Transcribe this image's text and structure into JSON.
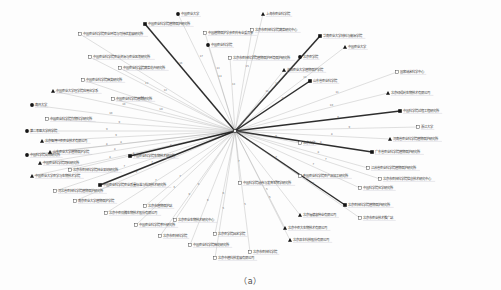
{
  "figure": {
    "caption": "（a）",
    "type": "radial-hub-network",
    "background": "#fdfdfd",
    "edge_color": "#8d8d8d",
    "edge_color_strong": "#1b1b1b",
    "label_color": "#3a3a3a",
    "weight_color": "#6e6e6e",
    "underline_color": "#b9b9c8"
  },
  "hub": {
    "label": "",
    "x": 235,
    "y": 131,
    "marker": "hub-point",
    "color": "#2a2a2a"
  },
  "legend_markers": {
    "filled-circle": "●",
    "hollow-square": "□",
    "filled-square": "■",
    "triangle": "▲"
  },
  "chart_data": {
    "type": "scatter",
    "title": "",
    "xlabel": "",
    "ylabel": "",
    "legend": [],
    "nodes": [
      {
        "id": 1,
        "label": "中国农业科学院植物保护研究所",
        "x": 145,
        "y": 24,
        "marker": "filled-square",
        "weight": "16",
        "side": "right",
        "strong": true
      },
      {
        "id": 2,
        "label": "中国农业科学院农业环境与可持续发展研究所",
        "x": 80,
        "y": 34,
        "marker": "hollow-square",
        "weight": "15",
        "side": "right",
        "strong": false
      },
      {
        "id": 3,
        "label": "中国植物保护学会农药专业委员会",
        "x": 205,
        "y": 33,
        "marker": "hollow-square",
        "weight": "13",
        "side": "right",
        "strong": false
      },
      {
        "id": 4,
        "label": "中国农业科学院农业资源与农业区划研究所",
        "x": 90,
        "y": 57,
        "marker": "hollow-square",
        "weight": "12",
        "side": "right",
        "strong": false
      },
      {
        "id": 5,
        "label": "中国农业科学院蔬菜花卉研究所",
        "x": 120,
        "y": 68,
        "marker": "hollow-square",
        "weight": "12",
        "side": "right",
        "strong": false
      },
      {
        "id": 6,
        "label": "中国农业科学院麻类研究所",
        "x": 83,
        "y": 80,
        "marker": "hollow-square",
        "weight": "11",
        "side": "right",
        "strong": false
      },
      {
        "id": 7,
        "label": "中国农业大学理学院应用化学系",
        "x": 53,
        "y": 91,
        "marker": "triangle",
        "weight": "10",
        "side": "right",
        "strong": false
      },
      {
        "id": 8,
        "label": "中国农业科学院植物研究所",
        "x": 113,
        "y": 99,
        "marker": "hollow-square",
        "weight": "10",
        "side": "right",
        "strong": false
      },
      {
        "id": 9,
        "label": "南开大学",
        "x": 32,
        "y": 105,
        "marker": "filled-circle",
        "weight": "10",
        "side": "right",
        "strong": false
      },
      {
        "id": 10,
        "label": "中国农业科学院作物科学研究所",
        "x": 47,
        "y": 119,
        "marker": "hollow-square",
        "weight": "9",
        "side": "right",
        "strong": false
      },
      {
        "id": 11,
        "label": "第二军医大学药学院",
        "x": 27,
        "y": 131,
        "marker": "filled-circle",
        "weight": "9",
        "side": "right",
        "strong": false
      },
      {
        "id": 12,
        "label": "北京智博兴农农业技术有限公司",
        "x": 42,
        "y": 141,
        "marker": "triangle",
        "weight": "9",
        "side": "right",
        "strong": false
      },
      {
        "id": 13,
        "label": "中国科学院动物研究所",
        "x": 27,
        "y": 155,
        "marker": "filled-circle",
        "weight": "8",
        "side": "right",
        "strong": false
      },
      {
        "id": 14,
        "label": "中国农业科学院饲料研究所",
        "x": 40,
        "y": 163,
        "marker": "triangle",
        "weight": "8",
        "side": "right",
        "strong": false
      },
      {
        "id": 15,
        "label": "中国农业大学农学与生物技术学院",
        "x": 32,
        "y": 176,
        "marker": "triangle",
        "weight": "8",
        "side": "right",
        "strong": false
      },
      {
        "id": 16,
        "label": "河北省农林科学院植物保护研究所",
        "x": 55,
        "y": 191,
        "marker": "hollow-square",
        "weight": "7",
        "side": "right",
        "strong": false
      },
      {
        "id": 17,
        "label": "南京农业大学植物保护学院",
        "x": 75,
        "y": 201,
        "marker": "hollow-square",
        "weight": "7",
        "side": "right",
        "strong": false
      },
      {
        "id": 18,
        "label": "北京中农劲腾生物技术股份有限公司",
        "x": 106,
        "y": 213,
        "marker": "hollow-square",
        "weight": "7",
        "side": "right",
        "strong": false
      },
      {
        "id": 19,
        "label": "中国农业科学院茶叶研究所",
        "x": 136,
        "y": 225,
        "marker": "hollow-square",
        "weight": "6",
        "side": "right",
        "strong": false
      },
      {
        "id": 20,
        "label": "北京市农林科学院",
        "x": 160,
        "y": 236,
        "marker": "hollow-square",
        "weight": "6",
        "side": "right",
        "strong": false
      },
      {
        "id": 21,
        "label": "中国农业科学院棉花研究所",
        "x": 190,
        "y": 245,
        "marker": "hollow-square",
        "weight": "6",
        "side": "right",
        "strong": false
      },
      {
        "id": 22,
        "label": "中国农业大学",
        "x": 178,
        "y": 14,
        "marker": "filled-circle",
        "weight": "17",
        "side": "right",
        "strong": false
      },
      {
        "id": 23,
        "label": "中国农业科学院",
        "x": 208,
        "y": 45,
        "marker": "filled-circle",
        "weight": "14",
        "side": "right",
        "strong": false
      },
      {
        "id": 24,
        "label": "北京市农林科学院植物保护环境保护研究所",
        "x": 230,
        "y": 58,
        "marker": "hollow-square",
        "weight": "13",
        "side": "right",
        "strong": false
      },
      {
        "id": 25,
        "label": "上海市农业科学院",
        "x": 263,
        "y": 14,
        "marker": "triangle",
        "weight": "17",
        "side": "right",
        "strong": false
      },
      {
        "id": 26,
        "label": "北京市农林科学院蔬菜研究中心",
        "x": 252,
        "y": 30,
        "marker": "hollow-square",
        "weight": "15",
        "side": "right",
        "strong": false
      },
      {
        "id": 27,
        "label": "华南农业大学材料与能源学院",
        "x": 320,
        "y": 36,
        "marker": "filled-square",
        "weight": "14",
        "side": "right",
        "strong": true
      },
      {
        "id": 28,
        "label": "中国农业大学",
        "x": 345,
        "y": 47,
        "marker": "triangle",
        "weight": "13",
        "side": "right",
        "strong": false
      },
      {
        "id": 29,
        "label": "北京农学院",
        "x": 300,
        "y": 57,
        "marker": "filled-circle",
        "weight": "12",
        "side": "right",
        "strong": false
      },
      {
        "id": 30,
        "label": "沈阳农业大学植物保护学院",
        "x": 284,
        "y": 70,
        "marker": "triangle",
        "weight": "11",
        "side": "right",
        "strong": false
      },
      {
        "id": 31,
        "label": "国家纳米科学中心",
        "x": 397,
        "y": 72,
        "marker": "hollow-square",
        "weight": "11",
        "side": "right",
        "strong": false
      },
      {
        "id": 32,
        "label": "山东省农业科学院",
        "x": 310,
        "y": 81,
        "marker": "filled-square",
        "weight": "10",
        "side": "right",
        "strong": true
      },
      {
        "id": 33,
        "label": "北京绿得利生物技术有限公司",
        "x": 388,
        "y": 93,
        "marker": "triangle",
        "weight": "10",
        "side": "right",
        "strong": false
      },
      {
        "id": 34,
        "label": "中国科学院过程工程研究所",
        "x": 400,
        "y": 111,
        "marker": "filled-square",
        "weight": "9",
        "side": "right",
        "strong": true
      },
      {
        "id": 35,
        "label": "浙江大学",
        "x": 418,
        "y": 127,
        "marker": "hollow-square",
        "weight": "9",
        "side": "right",
        "strong": false
      },
      {
        "id": 36,
        "label": "河南省农业科学院植物保护研究所",
        "x": 390,
        "y": 139,
        "marker": "triangle",
        "weight": "8",
        "side": "right",
        "strong": false
      },
      {
        "id": 37,
        "label": "广东省农业科学院植物保护研究所",
        "x": 372,
        "y": 152,
        "marker": "filled-square",
        "weight": "8",
        "side": "right",
        "strong": true
      },
      {
        "id": 38,
        "label": "江苏省农业科学院植物保护研究所",
        "x": 368,
        "y": 168,
        "marker": "hollow-square",
        "weight": "8",
        "side": "right",
        "strong": false
      },
      {
        "id": 39,
        "label": "北京市农林科学院信息技术研究中心",
        "x": 380,
        "y": 179,
        "marker": "hollow-square",
        "weight": "7",
        "side": "right",
        "strong": false
      },
      {
        "id": 40,
        "label": "中国科学院化学研究所",
        "x": 360,
        "y": 188,
        "marker": "hollow-square",
        "weight": "7",
        "side": "right",
        "strong": false
      },
      {
        "id": 41,
        "label": "中国农业科学院农产品加工研究所",
        "x": 300,
        "y": 176,
        "marker": "hollow-square",
        "weight": "7",
        "side": "right",
        "strong": false
      },
      {
        "id": 42,
        "label": "北京大学",
        "x": 300,
        "y": 143,
        "marker": "hollow-square",
        "weight": "9",
        "side": "right",
        "strong": false
      },
      {
        "id": 43,
        "label": "中国科学院遗传与发育生物学研究所",
        "x": 240,
        "y": 183,
        "marker": "hollow-square",
        "weight": "7",
        "side": "right",
        "strong": false
      },
      {
        "id": 44,
        "label": "北京农林科学院植物保护研究所",
        "x": 345,
        "y": 205,
        "marker": "filled-square",
        "weight": "6",
        "side": "right",
        "strong": true
      },
      {
        "id": 45,
        "label": "北京市农业技术推广站",
        "x": 360,
        "y": 218,
        "marker": "hollow-square",
        "weight": "6",
        "side": "right",
        "strong": false
      },
      {
        "id": 46,
        "label": "北京福德惠种业有限公司",
        "x": 300,
        "y": 215,
        "marker": "triangle",
        "weight": "6",
        "side": "right",
        "strong": false
      },
      {
        "id": 47,
        "label": "北京双丰科技股份有限公司",
        "x": 290,
        "y": 240,
        "marker": "triangle",
        "weight": "5",
        "side": "right",
        "strong": false
      },
      {
        "id": 48,
        "label": "北京中农大生物技术有限公司",
        "x": 285,
        "y": 228,
        "marker": "triangle",
        "weight": "5",
        "side": "right",
        "strong": false
      },
      {
        "id": 49,
        "label": "北京市农林科学院",
        "x": 250,
        "y": 252,
        "marker": "hollow-square",
        "weight": "5",
        "side": "right",
        "strong": false
      },
      {
        "id": 50,
        "label": "北京中植科技发展有限公司",
        "x": 215,
        "y": 258,
        "marker": "hollow-square",
        "weight": "5",
        "side": "right",
        "strong": false
      },
      {
        "id": 51,
        "label": "北京农学院园艺学院",
        "x": 215,
        "y": 234,
        "marker": "hollow-square",
        "weight": "6",
        "side": "right",
        "strong": false
      },
      {
        "id": 52,
        "label": "北京农业生物技术研究中心",
        "x": 175,
        "y": 220,
        "marker": "hollow-square",
        "weight": "6",
        "side": "right",
        "strong": false
      },
      {
        "id": 53,
        "label": "北京市植物保护站",
        "x": 145,
        "y": 206,
        "marker": "hollow-square",
        "weight": "7",
        "side": "right",
        "strong": false
      },
      {
        "id": 54,
        "label": "中国农业科学院农业质量标准与检测技术研究所",
        "x": 100,
        "y": 185,
        "marker": "filled-square",
        "weight": "7",
        "side": "right",
        "strong": true
      },
      {
        "id": 55,
        "label": "北京市农林科学院林业果树研究所",
        "x": 70,
        "y": 170,
        "marker": "hollow-square",
        "weight": "8",
        "side": "right",
        "strong": false
      },
      {
        "id": 56,
        "label": "中国农业科学院生物技术研究所",
        "x": 130,
        "y": 156,
        "marker": "filled-square",
        "weight": "8",
        "side": "right",
        "strong": true
      },
      {
        "id": 57,
        "label": "山东农业大学植物保护学院",
        "x": 50,
        "y": 152,
        "marker": "triangle",
        "weight": "8",
        "side": "right",
        "strong": false
      }
    ]
  }
}
